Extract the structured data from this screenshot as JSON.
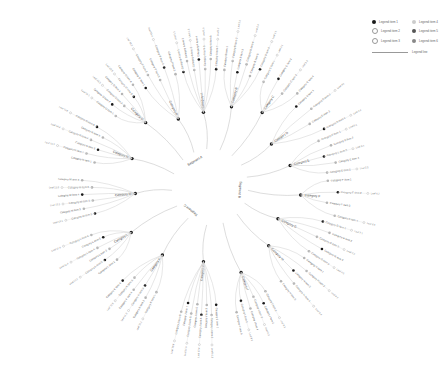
{
  "diagram": {
    "type": "radial-tree",
    "center": {
      "x": 210,
      "y": 187,
      "radius": 38,
      "ring_color": "#1a1a1a"
    },
    "ring_segments": [
      {
        "label": "Segment A",
        "angle": -120
      },
      {
        "label": "Segment B",
        "angle": 5
      },
      {
        "label": "Segment C",
        "angle": 130
      }
    ],
    "colors": {
      "primary_node": "#1a1a1a",
      "secondary_node": "#b5b5b5",
      "link": "#cfcfcf",
      "text": "#555555"
    }
  },
  "legend": {
    "items": [
      {
        "label": "Legend item 1",
        "color": "#1a1a1a"
      },
      {
        "label": "Legend item 2",
        "color": "#bdbdbd"
      },
      {
        "label": "Legend item 3",
        "color": "#bdbdbd"
      },
      {
        "label": "Legend item 4",
        "color": "#cccccc"
      },
      {
        "label": "Legend item 5",
        "color": "#555555"
      },
      {
        "label": "Legend item 6",
        "color": "#888888"
      }
    ],
    "line_label": "Legend line"
  },
  "branches": [
    {
      "label": "Category A",
      "angle": -95,
      "children": 7
    },
    {
      "label": "Category B",
      "angle": -75,
      "children": 6
    },
    {
      "label": "Category C",
      "angle": -55,
      "children": 4
    },
    {
      "label": "Category D",
      "angle": -35,
      "children": 4
    },
    {
      "label": "Category E",
      "angle": -15,
      "children": 5
    },
    {
      "label": "Category F",
      "angle": 5,
      "children": 4
    },
    {
      "label": "Category G",
      "angle": 25,
      "children": 5
    },
    {
      "label": "Category H",
      "angle": 45,
      "children": 5
    },
    {
      "label": "Category I",
      "angle": 70,
      "children": 6
    },
    {
      "label": "Category J",
      "angle": 95,
      "children": 8
    },
    {
      "label": "Category K",
      "angle": 125,
      "children": 6
    },
    {
      "label": "Category L",
      "angle": 150,
      "children": 6
    },
    {
      "label": "Category M",
      "angle": 175,
      "children": 6
    },
    {
      "label": "Category N",
      "angle": 200,
      "children": 6
    },
    {
      "label": "Category O",
      "angle": 225,
      "children": 6
    },
    {
      "label": "Category P",
      "angle": 245,
      "children": 5
    }
  ]
}
